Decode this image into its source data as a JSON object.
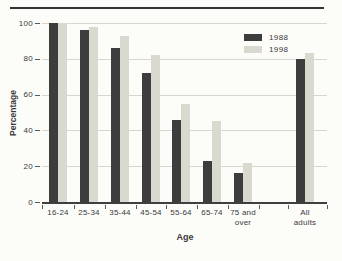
{
  "chart_data": {
    "type": "bar",
    "title": "",
    "xlabel": "Age",
    "ylabel": "Percentage",
    "ylim": [
      0,
      100
    ],
    "yticks": [
      0,
      20,
      40,
      60,
      80,
      100
    ],
    "grid": true,
    "legend_position": "inside-top-right",
    "categories": [
      "16-24",
      "25-34",
      "35-44",
      "45-54",
      "55-64",
      "65-74",
      "75 and\nover",
      "All\nadults"
    ],
    "series": [
      {
        "name": "1988",
        "color": "#3d3d3d",
        "values": [
          100,
          96,
          86,
          72,
          46,
          23,
          16,
          80
        ]
      },
      {
        "name": "1998",
        "color": "#d9d9d0",
        "values": [
          100,
          98,
          93,
          82,
          55,
          45,
          22,
          83
        ]
      }
    ]
  }
}
